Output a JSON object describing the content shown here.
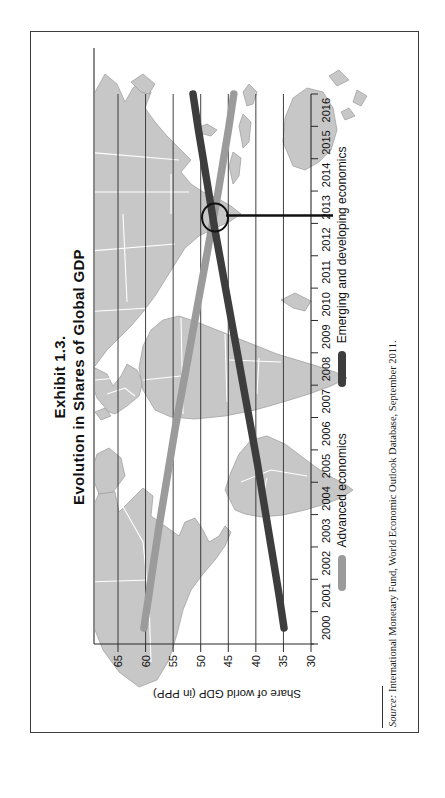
{
  "page": {
    "background": "#ffffff",
    "frame_color": "#3c3c3c"
  },
  "figure": {
    "title_line1": "Exhibit 1.3.",
    "title_line2": "Evolution in Shares of Global GDP",
    "source_label": "Source:",
    "source_text": "International Monetary Fund, World Economic Outlook Database, September 2011."
  },
  "chart_data": {
    "type": "line",
    "title": "Evolution in Shares of Global GDP",
    "ylabel": "Share of world GDP (in PPP)",
    "ylim": [
      30,
      69
    ],
    "yticks": [
      30,
      35,
      40,
      45,
      50,
      55,
      60,
      65
    ],
    "x": [
      2000,
      2001,
      2002,
      2003,
      2004,
      2005,
      2006,
      2007,
      2008,
      2009,
      2010,
      2011,
      2012,
      2013,
      2014,
      2015,
      2016
    ],
    "series": [
      {
        "name": "Advanced economics",
        "color": "#9b9b9b",
        "values": [
          60.3,
          59.4,
          58.5,
          57.6,
          56.6,
          55.6,
          54.6,
          53.5,
          52.4,
          51.3,
          50.2,
          49.1,
          48.0,
          46.9,
          45.9,
          44.9,
          44.0
        ]
      },
      {
        "name": "Emerging and developing economics",
        "color": "#3d3d3d",
        "values": [
          34.9,
          35.8,
          36.8,
          37.8,
          38.8,
          39.8,
          40.9,
          42.0,
          43.1,
          44.2,
          45.3,
          46.4,
          47.5,
          48.5,
          49.5,
          50.5,
          51.4
        ]
      }
    ],
    "legend_position": "bottom",
    "grid": "horizontal",
    "background": "world-map",
    "rotated_on_page": true,
    "annotation": {
      "shape": "circle",
      "year": 2012.3,
      "value": 47.4,
      "callout": "line-to-x-axis"
    }
  }
}
